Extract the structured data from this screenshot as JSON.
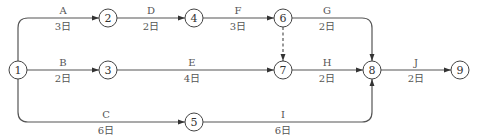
{
  "diagram": {
    "type": "double-code activity network (arrow diagram)",
    "nodes": [
      {
        "id": "1",
        "label": "1"
      },
      {
        "id": "2",
        "label": "2"
      },
      {
        "id": "3",
        "label": "3"
      },
      {
        "id": "4",
        "label": "4"
      },
      {
        "id": "5",
        "label": "5"
      },
      {
        "id": "6",
        "label": "6"
      },
      {
        "id": "7",
        "label": "7"
      },
      {
        "id": "8",
        "label": "8"
      },
      {
        "id": "9",
        "label": "9"
      }
    ],
    "activities": [
      {
        "name": "A",
        "duration": "3日",
        "from": "1",
        "to": "2"
      },
      {
        "name": "B",
        "duration": "2日",
        "from": "1",
        "to": "3"
      },
      {
        "name": "C",
        "duration": "6日",
        "from": "1",
        "to": "5"
      },
      {
        "name": "D",
        "duration": "2日",
        "from": "2",
        "to": "4"
      },
      {
        "name": "E",
        "duration": "4日",
        "from": "3",
        "to": "7"
      },
      {
        "name": "F",
        "duration": "3日",
        "from": "4",
        "to": "6"
      },
      {
        "name": "G",
        "duration": "2日",
        "from": "6",
        "to": "8"
      },
      {
        "name": "H",
        "duration": "2日",
        "from": "7",
        "to": "8"
      },
      {
        "name": "I",
        "duration": "6日",
        "from": "5",
        "to": "8"
      },
      {
        "name": "J",
        "duration": "2日",
        "from": "8",
        "to": "9"
      }
    ],
    "dummy_activities": [
      {
        "from": "6",
        "to": "7"
      }
    ]
  }
}
